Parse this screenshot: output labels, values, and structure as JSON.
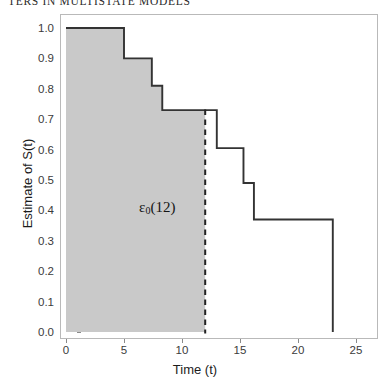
{
  "running_header": {
    "text": "TERS IN MULTISTATE MODELS"
  },
  "axes": {
    "y_title": "Estimate of S(t)",
    "x_title": "Time (t)",
    "y_ticks": [
      "0.0",
      "0.1",
      "0.2",
      "0.3",
      "0.4",
      "0.5",
      "0.6",
      "0.7",
      "0.8",
      "0.9",
      "1.0"
    ],
    "x_ticks": [
      "0",
      "5",
      "10",
      "15",
      "20",
      "25"
    ]
  },
  "annotation": {
    "symbol": "ε",
    "subscript": "0",
    "argument": "(12)",
    "full_text": "ε0(12)"
  },
  "colors": {
    "curve": "#333333",
    "shaded_region": "#c9c9c9",
    "shaded_region_border": "#333333",
    "cutoff_line": "#222222",
    "frame": "#b9b9b9",
    "tick": "#8a8a8a",
    "text": "#1c1c1c"
  },
  "chart_data": {
    "type": "line",
    "title": "",
    "xlabel": "Time (t)",
    "ylabel": "Estimate of S(t)",
    "xlim": [
      -1.2,
      26.5
    ],
    "ylim": [
      0.0,
      1.0
    ],
    "grid": false,
    "legend": null,
    "step_style": "post",
    "series": [
      {
        "name": "Kaplan-Meier estimate of S(t)",
        "x": [
          0,
          5,
          5,
          7.4,
          7.4,
          8.3,
          8.3,
          12,
          13,
          13,
          15.3,
          15.3,
          16.2,
          16.2,
          23,
          23
        ],
        "y": [
          1.0,
          1.0,
          0.9,
          0.9,
          0.81,
          0.81,
          0.73,
          0.73,
          0.73,
          0.605,
          0.605,
          0.49,
          0.49,
          0.37,
          0.37,
          0.0
        ]
      }
    ],
    "step_points": [
      {
        "t": 0,
        "s": 1.0
      },
      {
        "t": 5,
        "s": 0.9
      },
      {
        "t": 7.4,
        "s": 0.81
      },
      {
        "t": 8.3,
        "s": 0.73
      },
      {
        "t": 13,
        "s": 0.605
      },
      {
        "t": 15.3,
        "s": 0.49
      },
      {
        "t": 16.2,
        "s": 0.37
      },
      {
        "t": 23,
        "s": 0.0
      }
    ],
    "annotations": [
      {
        "type": "shaded-area",
        "label": "ε0(12)",
        "x_from": 0,
        "x_to": 12,
        "y_from": 0.0,
        "y_to": "S(t)",
        "color": "#c9c9c9",
        "description": "Area under the survival curve from t=0 to t=12"
      },
      {
        "type": "vertical-dashed-line",
        "x": 12,
        "color": "#222222",
        "description": "Cutoff at t = 12"
      },
      {
        "type": "text",
        "text": "ε0(12)",
        "x": 6.3,
        "y": 0.405
      }
    ]
  }
}
